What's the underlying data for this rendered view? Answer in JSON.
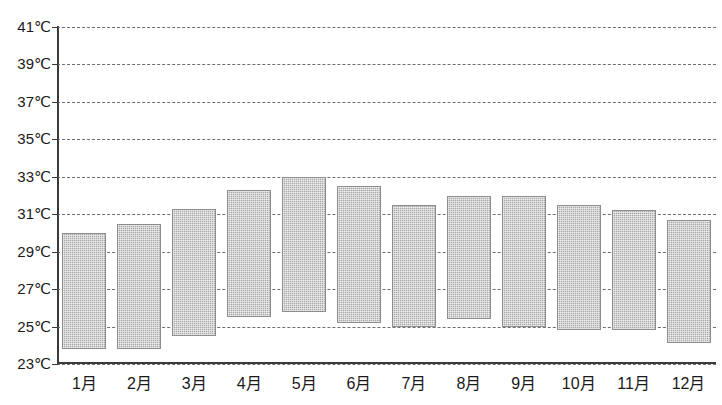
{
  "chart_data": {
    "type": "bar",
    "subtype": "floating-range-bar",
    "title": "",
    "subtitle": "",
    "xlabel": "",
    "ylabel": "",
    "unit": "℃",
    "ylim": [
      23,
      41
    ],
    "ytick_step": 2,
    "grid": true,
    "grid_style": "dashed-horizontal",
    "legend": null,
    "categories": [
      "1月",
      "2月",
      "3月",
      "4月",
      "5月",
      "6月",
      "7月",
      "8月",
      "9月",
      "10月",
      "11月",
      "12月"
    ],
    "ytick_labels": [
      "41℃",
      "39℃",
      "37℃",
      "35℃",
      "33℃",
      "31℃",
      "29℃",
      "27℃",
      "25℃",
      "23℃"
    ],
    "ytick_values": [
      41,
      39,
      37,
      35,
      33,
      31,
      29,
      27,
      25,
      23
    ],
    "series": [
      {
        "name": "月別気温範囲",
        "type": "range",
        "high": [
          30.0,
          30.5,
          31.3,
          32.3,
          33.0,
          32.5,
          31.5,
          32.0,
          32.0,
          31.5,
          31.2,
          30.7
        ],
        "low": [
          23.8,
          23.8,
          24.5,
          25.5,
          25.8,
          25.2,
          25.0,
          25.4,
          25.0,
          24.8,
          24.8,
          24.1
        ]
      }
    ],
    "bar_color": "#a8a8a8",
    "bar_border_color": "#8d8d8d",
    "axis_color": "#3a3a3a",
    "grid_color": "#6e6e6e"
  }
}
